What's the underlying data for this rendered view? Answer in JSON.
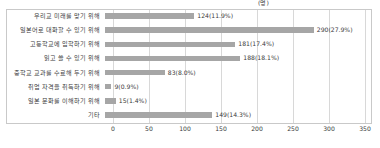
{
  "chart_data": {
    "type": "bar",
    "orientation": "horizontal",
    "title": "",
    "xlabel": "",
    "ylabel": "",
    "unit_label": "(명)",
    "xlim": [
      0,
      350
    ],
    "xticks": [
      "0",
      "50",
      "100",
      "150",
      "200",
      "250",
      "300",
      "350"
    ],
    "grid": true,
    "legend": false,
    "bar_color": "#a6a6a6",
    "categories": [
      "우리교 미래를 맞기 위해",
      "일본어로 대화할 수 있기 위해",
      "고등학교에 입학하기 위해",
      "읽고 쓸 수 있기 위해",
      "중학교 교과를 수료해 두기 위해",
      "취업 자격을 취득하기 위해",
      "일본 문화를 이해하기 위해",
      "기타"
    ],
    "values": [
      124,
      290,
      181,
      188,
      83,
      9,
      15,
      149
    ],
    "percents": [
      "11.9%",
      "27.9%",
      "17.4%",
      "18.1%",
      "8.0%",
      "0.9%",
      "1.4%",
      "14.3%"
    ],
    "data_labels": [
      "124(11.9%)",
      "290(27.9%)",
      "181(17.4%)",
      "188(18.1%)",
      "83(8.0%)",
      "9(0.9%)",
      "15(1.4%)",
      "149(14.3%)"
    ]
  }
}
